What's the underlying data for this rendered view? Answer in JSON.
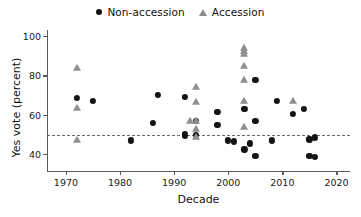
{
  "chart_data": {
    "type": "scatter",
    "title": "",
    "xlabel": "Decade",
    "ylabel": "Yes vote (percent)",
    "xlim": [
      1966.5,
      2022.5
    ],
    "ylim": [
      31,
      103
    ],
    "xticks": [
      1970,
      1980,
      1990,
      2000,
      2010,
      2020
    ],
    "xticklabels": [
      "1970",
      "1980",
      "1990",
      "2000",
      "2010",
      "2020"
    ],
    "yticks": [
      40,
      60,
      80,
      100
    ],
    "yticklabels": [
      "40",
      "60",
      "80",
      "100"
    ],
    "grid": false,
    "legend_position": "top-center",
    "annotations": [
      {
        "type": "hline",
        "y": 50,
        "style": "dashed",
        "color": "#6b6b6b",
        "label": ""
      }
    ],
    "series": [
      {
        "name": "Non-accession",
        "marker": "circle",
        "color": "#141414",
        "points": [
          {
            "x": 1972,
            "y": 68.5
          },
          {
            "x": 1975,
            "y": 67.0
          },
          {
            "x": 1982,
            "y": 47.0
          },
          {
            "x": 1986,
            "y": 56.0
          },
          {
            "x": 1987,
            "y": 70.0
          },
          {
            "x": 1992,
            "y": 69.0
          },
          {
            "x": 1992,
            "y": 50.5
          },
          {
            "x": 1992,
            "y": 49.5
          },
          {
            "x": 1994,
            "y": 57.0
          },
          {
            "x": 1994,
            "y": 50.0
          },
          {
            "x": 1998,
            "y": 61.5
          },
          {
            "x": 1998,
            "y": 55.0
          },
          {
            "x": 2000,
            "y": 47.0
          },
          {
            "x": 2001,
            "y": 46.5
          },
          {
            "x": 2003,
            "y": 63.0
          },
          {
            "x": 2003,
            "y": 42.5
          },
          {
            "x": 2005,
            "y": 77.5
          },
          {
            "x": 2005,
            "y": 57.0
          },
          {
            "x": 2004,
            "y": 45.5
          },
          {
            "x": 2005,
            "y": 39.0
          },
          {
            "x": 2008,
            "y": 47.0
          },
          {
            "x": 2009,
            "y": 67.0
          },
          {
            "x": 2012,
            "y": 60.5
          },
          {
            "x": 2014,
            "y": 63.0
          },
          {
            "x": 2015,
            "y": 47.5
          },
          {
            "x": 2016,
            "y": 48.5
          },
          {
            "x": 2015,
            "y": 39.0
          },
          {
            "x": 2016,
            "y": 38.5
          }
        ]
      },
      {
        "name": "Accession",
        "marker": "triangle",
        "color": "#8f8f8f",
        "points": [
          {
            "x": 1972,
            "y": 83.5
          },
          {
            "x": 1972,
            "y": 63.5
          },
          {
            "x": 1972,
            "y": 47.0
          },
          {
            "x": 1993,
            "y": 57.0
          },
          {
            "x": 1994,
            "y": 74.0
          },
          {
            "x": 1994,
            "y": 66.5
          },
          {
            "x": 1994,
            "y": 57.0
          },
          {
            "x": 1994,
            "y": 53.0
          },
          {
            "x": 1994,
            "y": 48.5
          },
          {
            "x": 2003,
            "y": 94.0
          },
          {
            "x": 2003,
            "y": 92.5
          },
          {
            "x": 2003,
            "y": 91.0
          },
          {
            "x": 2003,
            "y": 84.5
          },
          {
            "x": 2003,
            "y": 77.5
          },
          {
            "x": 2003,
            "y": 67.0
          },
          {
            "x": 2003,
            "y": 54.0
          },
          {
            "x": 2012,
            "y": 67.0
          }
        ]
      }
    ]
  },
  "legend": {
    "entries": [
      {
        "label": "Non-accession",
        "marker": "circle-marker-icon"
      },
      {
        "label": "Accession",
        "marker": "triangle-marker-icon"
      }
    ]
  },
  "colors": {
    "non_accession": "#141414",
    "accession": "#8f8f8f",
    "axis": "#5a5a5a",
    "refline": "#6b6b6b",
    "background": "#ffffff"
  }
}
